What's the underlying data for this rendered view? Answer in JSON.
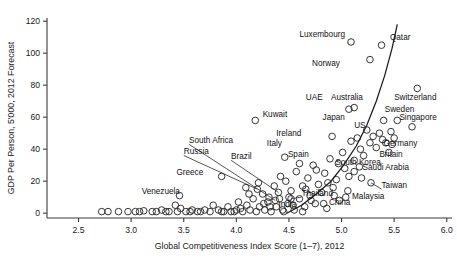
{
  "chart_data": {
    "type": "scatter",
    "title": "",
    "xlabel": "Global Competitiveness Index Score (1–7), 2012",
    "ylabel": "GDP Per Person, 5'000, 2012 Forecast",
    "xlim": [
      2.2,
      6.05
    ],
    "ylim": [
      -3,
      122
    ],
    "xticks": [
      "2.5",
      "3.0",
      "3.5",
      "4.0",
      "4.5",
      "5.0",
      "5.5",
      "6.0"
    ],
    "xtick_values": [
      2.5,
      3.0,
      3.5,
      4.0,
      4.5,
      5.0,
      5.5,
      6.0
    ],
    "yticks": [
      "0",
      "20",
      "40",
      "60",
      "80",
      "100",
      "120"
    ],
    "ytick_values": [
      0,
      20,
      40,
      60,
      80,
      100,
      120
    ],
    "grid": false,
    "legend": "none",
    "marker": "open-circle",
    "labeled_points": [
      {
        "name": "Luxembourg",
        "x": 5.09,
        "y": 107,
        "lx": 4.6,
        "ly": 110,
        "anchor": "start",
        "leader": false
      },
      {
        "name": "Qatar",
        "x": 5.38,
        "y": 105,
        "lx": 5.46,
        "ly": 108,
        "anchor": "start",
        "leader": false
      },
      {
        "name": "Norway",
        "x": 5.27,
        "y": 96,
        "lx": 4.72,
        "ly": 92,
        "anchor": "start",
        "leader": false
      },
      {
        "name": "Switzerland",
        "x": 5.72,
        "y": 78,
        "lx": 5.5,
        "ly": 71,
        "anchor": "start",
        "leader": false
      },
      {
        "name": "Australia",
        "x": 5.12,
        "y": 66,
        "lx": 4.9,
        "ly": 71,
        "anchor": "start",
        "leader": false
      },
      {
        "name": "UAE",
        "x": 5.07,
        "y": 65,
        "lx": 4.66,
        "ly": 71,
        "anchor": "start",
        "leader": false
      },
      {
        "name": "Sweden",
        "x": 5.53,
        "y": 58,
        "lx": 5.41,
        "ly": 63,
        "anchor": "start",
        "leader": false
      },
      {
        "name": "Singapore",
        "x": 5.67,
        "y": 54,
        "lx": 5.55,
        "ly": 58,
        "anchor": "start",
        "leader": false
      },
      {
        "name": "Kuwait",
        "x": 4.18,
        "y": 58,
        "lx": 4.25,
        "ly": 60,
        "anchor": "start",
        "leader": false
      },
      {
        "name": "Japan",
        "x": 5.4,
        "y": 58,
        "lx": 4.82,
        "ly": 58,
        "anchor": "start",
        "leader": false
      },
      {
        "name": "US",
        "x": 5.47,
        "y": 51,
        "lx": 5.12,
        "ly": 53,
        "anchor": "start",
        "leader": false
      },
      {
        "name": "Ireland",
        "x": 4.91,
        "y": 48,
        "lx": 4.38,
        "ly": 48,
        "anchor": "start",
        "leader": false
      },
      {
        "name": "Germany",
        "x": 5.48,
        "y": 43,
        "lx": 5.4,
        "ly": 42,
        "anchor": "start",
        "leader": false
      },
      {
        "name": "Britain",
        "x": 5.45,
        "y": 38,
        "lx": 5.36,
        "ly": 35,
        "anchor": "start",
        "leader": false
      },
      {
        "name": "Italy",
        "x": 4.46,
        "y": 35,
        "lx": 4.29,
        "ly": 42,
        "anchor": "start",
        "leader": false
      },
      {
        "name": "Spain",
        "x": 4.6,
        "y": 31,
        "lx": 4.49,
        "ly": 35,
        "anchor": "start",
        "leader": false
      },
      {
        "name": "South Korea",
        "x": 5.12,
        "y": 26,
        "lx": 4.94,
        "ly": 30,
        "anchor": "start",
        "leader": false
      },
      {
        "name": "Saudi Arabia",
        "x": 5.19,
        "y": 22,
        "lx": 5.2,
        "ly": 27,
        "anchor": "start",
        "leader": false
      },
      {
        "name": "Taiwan",
        "x": 5.28,
        "y": 19,
        "lx": 5.38,
        "ly": 16,
        "anchor": "start",
        "leader": true
      },
      {
        "name": "Malaysia",
        "x": 5.04,
        "y": 10,
        "lx": 5.1,
        "ly": 9,
        "anchor": "start",
        "leader": false
      },
      {
        "name": "China",
        "x": 4.83,
        "y": 6,
        "lx": 4.88,
        "ly": 5,
        "anchor": "start",
        "leader": false
      },
      {
        "name": "Thailand",
        "x": 4.52,
        "y": 9,
        "lx": 4.62,
        "ly": 11,
        "anchor": "start",
        "leader": true
      },
      {
        "name": "India",
        "x": 4.32,
        "y": 4,
        "lx": 4.4,
        "ly": 4,
        "anchor": "start",
        "leader": false
      },
      {
        "name": "Brazil",
        "x": 4.4,
        "y": 13,
        "lx": 3.95,
        "ly": 34,
        "anchor": "start",
        "leader": true
      },
      {
        "name": "South Africa",
        "x": 4.37,
        "y": 8,
        "lx": 3.55,
        "ly": 44,
        "anchor": "start",
        "leader": true
      },
      {
        "name": "Russia",
        "x": 4.2,
        "y": 15,
        "lx": 3.5,
        "ly": 37,
        "anchor": "start",
        "leader": true
      },
      {
        "name": "Greece",
        "x": 3.86,
        "y": 23,
        "lx": 3.43,
        "ly": 24,
        "anchor": "start",
        "leader": false
      },
      {
        "name": "Venezuela",
        "x": 3.46,
        "y": 11,
        "lx": 3.1,
        "ly": 12,
        "anchor": "start",
        "leader": false
      }
    ],
    "background_points": [
      {
        "x": 2.78,
        "y": 1
      },
      {
        "x": 2.88,
        "y": 1
      },
      {
        "x": 2.97,
        "y": 1
      },
      {
        "x": 3.04,
        "y": 1
      },
      {
        "x": 3.12,
        "y": 1.5
      },
      {
        "x": 3.2,
        "y": 1
      },
      {
        "x": 3.29,
        "y": 2
      },
      {
        "x": 3.36,
        "y": 1
      },
      {
        "x": 3.42,
        "y": 5
      },
      {
        "x": 3.44,
        "y": 1
      },
      {
        "x": 3.52,
        "y": 1
      },
      {
        "x": 3.58,
        "y": 2
      },
      {
        "x": 3.63,
        "y": 1
      },
      {
        "x": 3.7,
        "y": 2
      },
      {
        "x": 3.75,
        "y": 1
      },
      {
        "x": 3.78,
        "y": 5
      },
      {
        "x": 3.83,
        "y": 2
      },
      {
        "x": 3.88,
        "y": 1
      },
      {
        "x": 3.92,
        "y": 4
      },
      {
        "x": 3.95,
        "y": 1
      },
      {
        "x": 4.0,
        "y": 2
      },
      {
        "x": 4.02,
        "y": 7
      },
      {
        "x": 4.06,
        "y": 1
      },
      {
        "x": 4.1,
        "y": 5
      },
      {
        "x": 4.13,
        "y": 2
      },
      {
        "x": 4.16,
        "y": 9
      },
      {
        "x": 4.19,
        "y": 1
      },
      {
        "x": 4.22,
        "y": 4
      },
      {
        "x": 4.25,
        "y": 12
      },
      {
        "x": 4.27,
        "y": 2
      },
      {
        "x": 4.3,
        "y": 7
      },
      {
        "x": 4.33,
        "y": 1
      },
      {
        "x": 4.36,
        "y": 17
      },
      {
        "x": 4.38,
        "y": 4
      },
      {
        "x": 4.41,
        "y": 9
      },
      {
        "x": 4.44,
        "y": 2
      },
      {
        "x": 4.47,
        "y": 20
      },
      {
        "x": 4.49,
        "y": 6
      },
      {
        "x": 4.52,
        "y": 14
      },
      {
        "x": 4.55,
        "y": 2
      },
      {
        "x": 4.57,
        "y": 26
      },
      {
        "x": 4.6,
        "y": 9
      },
      {
        "x": 4.63,
        "y": 17
      },
      {
        "x": 4.65,
        "y": 4
      },
      {
        "x": 4.68,
        "y": 22
      },
      {
        "x": 4.7,
        "y": 11
      },
      {
        "x": 4.73,
        "y": 30
      },
      {
        "x": 4.75,
        "y": 6
      },
      {
        "x": 4.78,
        "y": 18
      },
      {
        "x": 4.81,
        "y": 13
      },
      {
        "x": 4.84,
        "y": 25
      },
      {
        "x": 4.86,
        "y": 3
      },
      {
        "x": 4.89,
        "y": 34
      },
      {
        "x": 4.92,
        "y": 16
      },
      {
        "x": 4.95,
        "y": 21
      },
      {
        "x": 4.98,
        "y": 8
      },
      {
        "x": 5.01,
        "y": 38
      },
      {
        "x": 5.03,
        "y": 28
      },
      {
        "x": 5.06,
        "y": 14
      },
      {
        "x": 5.09,
        "y": 45
      },
      {
        "x": 5.12,
        "y": 33
      },
      {
        "x": 5.15,
        "y": 47
      },
      {
        "x": 5.18,
        "y": 40
      },
      {
        "x": 5.21,
        "y": 36
      },
      {
        "x": 5.24,
        "y": 52
      },
      {
        "x": 5.27,
        "y": 44
      },
      {
        "x": 5.3,
        "y": 48
      },
      {
        "x": 5.33,
        "y": 41
      },
      {
        "x": 5.36,
        "y": 50
      },
      {
        "x": 5.39,
        "y": 46
      },
      {
        "x": 5.42,
        "y": 44
      },
      {
        "x": 5.5,
        "y": 47
      },
      {
        "x": 3.33,
        "y": 1
      },
      {
        "x": 3.47,
        "y": 3
      },
      {
        "x": 3.66,
        "y": 1
      },
      {
        "x": 3.86,
        "y": 1
      },
      {
        "x": 4.04,
        "y": 3
      },
      {
        "x": 4.12,
        "y": 12
      },
      {
        "x": 4.21,
        "y": 19
      },
      {
        "x": 4.31,
        "y": 10
      },
      {
        "x": 4.42,
        "y": 23
      },
      {
        "x": 4.54,
        "y": 5
      },
      {
        "x": 4.66,
        "y": 15
      },
      {
        "x": 4.76,
        "y": 27
      },
      {
        "x": 4.87,
        "y": 19
      },
      {
        "x": 4.97,
        "y": 31
      },
      {
        "x": 5.07,
        "y": 23
      },
      {
        "x": 5.17,
        "y": 29
      },
      {
        "x": 2.72,
        "y": 1
      },
      {
        "x": 3.08,
        "y": 1
      },
      {
        "x": 3.24,
        "y": 1
      },
      {
        "x": 3.56,
        "y": 1
      },
      {
        "x": 3.98,
        "y": 1
      },
      {
        "x": 4.45,
        "y": 1
      },
      {
        "x": 4.63,
        "y": 1
      },
      {
        "x": 4.09,
        "y": 16
      },
      {
        "x": 4.26,
        "y": 6
      },
      {
        "x": 4.5,
        "y": 10
      },
      {
        "x": 4.71,
        "y": 8
      },
      {
        "x": 4.93,
        "y": 11
      }
    ],
    "trend_curve": [
      {
        "x": 4.48,
        "y": 0
      },
      {
        "x": 4.62,
        "y": 5
      },
      {
        "x": 4.76,
        "y": 12
      },
      {
        "x": 4.9,
        "y": 20
      },
      {
        "x": 5.02,
        "y": 30
      },
      {
        "x": 5.14,
        "y": 42
      },
      {
        "x": 5.24,
        "y": 55
      },
      {
        "x": 5.33,
        "y": 70
      },
      {
        "x": 5.41,
        "y": 86
      },
      {
        "x": 5.48,
        "y": 103
      },
      {
        "x": 5.53,
        "y": 118
      }
    ]
  }
}
